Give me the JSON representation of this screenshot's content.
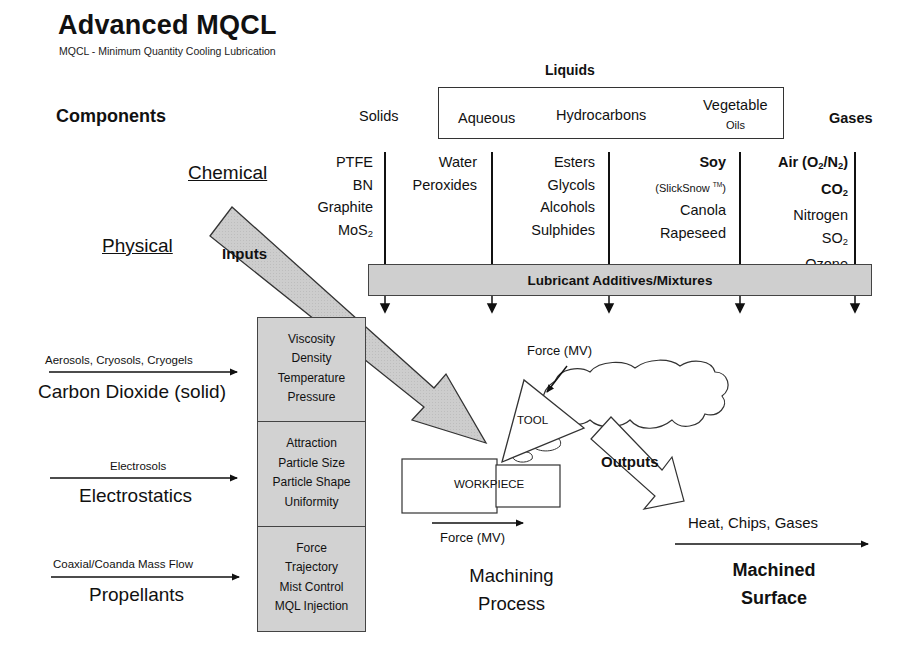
{
  "header": {
    "title": "Advanced MQCL",
    "subtitle": "MQCL - Minimum Quantity Cooling Lubrication"
  },
  "components": {
    "label": "Components",
    "liquids_title": "Liquids",
    "categories": {
      "solids": "Solids",
      "aqueous": "Aqueous",
      "hydrocarbons": "Hydrocarbons",
      "vegetable_line1": "Vegetable",
      "vegetable_line2": "Oils",
      "gases": "Gases"
    }
  },
  "rows": {
    "chemical": "Chemical",
    "physical": "Physical"
  },
  "columns": {
    "solids": [
      "PTFE",
      "BN",
      "Graphite",
      "MoS2"
    ],
    "aqueous": [
      "Water",
      "Peroxides"
    ],
    "hydrocarbons": [
      "Esters",
      "Glycols",
      "Alcohols",
      "Sulphides"
    ],
    "vegetable": [
      "Soy",
      "(SlickSnow TM)",
      "Canola",
      "Rapeseed"
    ],
    "gases": [
      "Air (O2/N2)",
      "CO2",
      "Nitrogen",
      "SO2",
      "Ozone"
    ]
  },
  "lubricant_bar": "Lubricant Additives/Mixtures",
  "inputs_arrow": "Inputs",
  "outputs_arrow": "Outputs",
  "physical_inputs": [
    {
      "sub_label": "Aerosols, Cryosols, Cryogels",
      "label": "Carbon Dioxide (solid)",
      "properties": [
        "Viscosity",
        "Density",
        "Temperature",
        "Pressure"
      ]
    },
    {
      "sub_label": "Electrosols",
      "label": "Electrostatics",
      "properties": [
        "Attraction",
        "Particle Size",
        "Particle Shape",
        "Uniformity"
      ]
    },
    {
      "sub_label": "Coaxial/Coanda Mass Flow",
      "label": "Propellants",
      "properties": [
        "Force",
        "Trajectory",
        "Mist Control",
        "MQL Injection"
      ]
    }
  ],
  "machining": {
    "tool_label": "TOOL",
    "workpiece_label": "WORKPIECE",
    "force_top": "Force (MV)",
    "force_bottom": "Force (MV)",
    "process_line1": "Machining",
    "process_line2": "Process"
  },
  "output": {
    "byproducts": "Heat, Chips, Gases",
    "result_line1": "Machined",
    "result_line2": "Surface"
  },
  "colors": {
    "fill_gray": "#cfcfcf",
    "stroke": "#333333",
    "text": "#111111"
  }
}
